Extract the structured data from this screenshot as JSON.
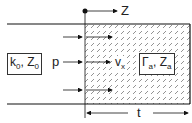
{
  "diagram": {
    "axis_label": "Z",
    "left_medium": {
      "k": "k",
      "k_sub": "0",
      "z": "Z",
      "z_sub": "0"
    },
    "incident_label": "p",
    "particle_velocity": {
      "v": "v",
      "v_sub": "x"
    },
    "layer_medium": {
      "gamma": "Γ",
      "gamma_sub": "a",
      "z": "Z",
      "z_sub": "a"
    },
    "thickness_label": "t",
    "separator": ", ",
    "colors": {
      "line": "#111111",
      "hatch": "#555555",
      "background": "#ffffff"
    }
  }
}
